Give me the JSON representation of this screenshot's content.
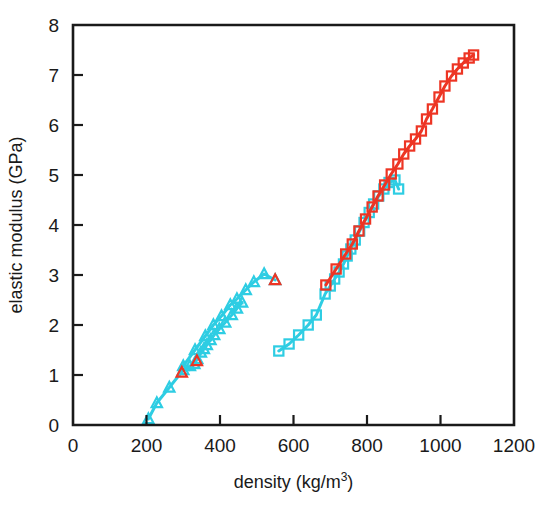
{
  "chart_data": {
    "type": "scatter",
    "title": "",
    "xlabel": "density (kg/m3)",
    "xlabel_base": "density (kg/m",
    "xlabel_sup": "3",
    "xlabel_tail": ")",
    "ylabel": "elastic modulus (GPa)",
    "xlim": [
      0,
      1200
    ],
    "ylim": [
      0,
      8
    ],
    "xticks": [
      0,
      200,
      400,
      600,
      800,
      1000,
      1200
    ],
    "xtick_labels": [
      "0",
      "200",
      "400",
      "600",
      "800",
      "1000",
      "1200"
    ],
    "yticks": [
      0,
      1,
      2,
      3,
      4,
      5,
      6,
      7,
      8
    ],
    "ytick_labels": [
      "0",
      "1",
      "2",
      "3",
      "4",
      "5",
      "6",
      "7",
      "8"
    ],
    "grid": false,
    "legend": "none",
    "colors": {
      "cyan": "#2ecde3",
      "red": "#ed3524",
      "axis": "#1a1a1a"
    },
    "series": [
      {
        "name": "cyan-triangles-lower-line",
        "marker": "triangle",
        "color": "#2ecde3",
        "connected": true,
        "points": [
          [
            205,
            0.12
          ],
          [
            228,
            0.44
          ],
          [
            262,
            0.75
          ],
          [
            300,
            1.1
          ],
          [
            318,
            1.18
          ],
          [
            330,
            1.22
          ],
          [
            338,
            1.32
          ],
          [
            348,
            1.45
          ],
          [
            356,
            1.52
          ],
          [
            364,
            1.6
          ],
          [
            374,
            1.7
          ],
          [
            384,
            1.8
          ],
          [
            398,
            1.92
          ],
          [
            414,
            2.05
          ],
          [
            432,
            2.2
          ],
          [
            446,
            2.33
          ],
          [
            460,
            2.45
          ]
        ]
      },
      {
        "name": "cyan-triangles-upper-line",
        "marker": "triangle",
        "color": "#2ecde3",
        "connected": true,
        "points": [
          [
            300,
            1.18
          ],
          [
            332,
            1.5
          ],
          [
            360,
            1.78
          ],
          [
            382,
            2.0
          ],
          [
            404,
            2.18
          ],
          [
            428,
            2.4
          ],
          [
            446,
            2.52
          ],
          [
            470,
            2.7
          ],
          [
            492,
            2.86
          ],
          [
            520,
            3.02
          ],
          [
            550,
            2.9
          ]
        ]
      },
      {
        "name": "red-triangles",
        "marker": "triangle",
        "color": "#ed3524",
        "connected": false,
        "points": [
          [
            296,
            1.05
          ],
          [
            337,
            1.28
          ],
          [
            550,
            2.9
          ]
        ]
      },
      {
        "name": "cyan-squares",
        "marker": "square",
        "color": "#2ecde3",
        "connected": true,
        "points": [
          [
            560,
            1.48
          ],
          [
            588,
            1.62
          ],
          [
            614,
            1.8
          ],
          [
            640,
            2.0
          ],
          [
            662,
            2.2
          ],
          [
            686,
            2.62
          ],
          [
            700,
            2.78
          ],
          [
            712,
            2.92
          ],
          [
            724,
            3.06
          ],
          [
            736,
            3.22
          ],
          [
            746,
            3.38
          ],
          [
            756,
            3.52
          ],
          [
            768,
            3.7
          ],
          [
            780,
            3.88
          ],
          [
            792,
            4.05
          ],
          [
            806,
            4.25
          ],
          [
            818,
            4.42
          ],
          [
            832,
            4.58
          ],
          [
            846,
            4.72
          ],
          [
            860,
            4.85
          ],
          [
            876,
            4.9
          ],
          [
            886,
            4.72
          ]
        ]
      },
      {
        "name": "red-squares",
        "marker": "square",
        "color": "#ed3524",
        "connected": true,
        "points": [
          [
            688,
            2.8
          ],
          [
            716,
            3.12
          ],
          [
            742,
            3.42
          ],
          [
            760,
            3.62
          ],
          [
            778,
            3.88
          ],
          [
            796,
            4.12
          ],
          [
            814,
            4.36
          ],
          [
            830,
            4.58
          ],
          [
            848,
            4.8
          ],
          [
            866,
            5.02
          ],
          [
            884,
            5.22
          ],
          [
            900,
            5.42
          ],
          [
            916,
            5.58
          ],
          [
            932,
            5.72
          ],
          [
            948,
            5.88
          ],
          [
            962,
            6.12
          ],
          [
            978,
            6.32
          ],
          [
            996,
            6.56
          ],
          [
            1012,
            6.78
          ],
          [
            1030,
            6.98
          ],
          [
            1046,
            7.12
          ],
          [
            1062,
            7.24
          ],
          [
            1078,
            7.34
          ],
          [
            1090,
            7.4
          ]
        ]
      }
    ]
  }
}
